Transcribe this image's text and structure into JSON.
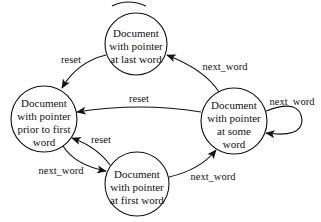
{
  "diagram": {
    "type": "state-machine",
    "states": {
      "prior": {
        "lines": [
          "Document",
          "with pointer",
          "prior to first",
          "word"
        ],
        "cx": 44,
        "cy": 119,
        "r": 33
      },
      "first": {
        "lines": [
          "Document",
          "with pointer",
          "at first word"
        ],
        "cx": 137,
        "cy": 184,
        "r": 32
      },
      "some": {
        "lines": [
          "Document",
          "with pointer",
          "at some",
          "word"
        ],
        "cx": 234,
        "cy": 121,
        "r": 33
      },
      "last": {
        "lines": [
          "Document",
          "with pointer",
          "at last word"
        ],
        "cx": 136,
        "cy": 44,
        "r": 31
      }
    },
    "transitions": {
      "last_to_prior": {
        "from": "last",
        "to": "prior",
        "label": "reset"
      },
      "some_to_prior": {
        "from": "some",
        "to": "prior",
        "label": "reset"
      },
      "first_to_prior": {
        "from": "first",
        "to": "prior",
        "label": "reset"
      },
      "prior_to_first": {
        "from": "prior",
        "to": "first",
        "label": "next_word"
      },
      "first_to_some": {
        "from": "first",
        "to": "some",
        "label": "next_word"
      },
      "some_to_last": {
        "from": "some",
        "to": "last",
        "label": "next_word"
      },
      "some_to_some": {
        "from": "some",
        "to": "some",
        "label": "next_word"
      }
    },
    "colors": {
      "stroke": "#111111",
      "background": "#ffffff"
    }
  }
}
